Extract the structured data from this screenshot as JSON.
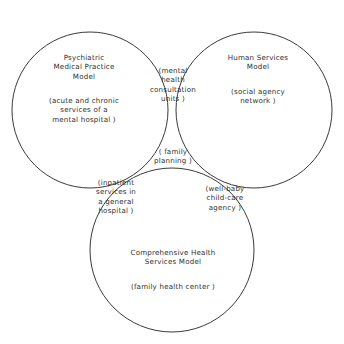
{
  "diagram": {
    "type": "venn",
    "title": "",
    "background_color": "#ffffff",
    "stroke_color": "#3a3a3a",
    "text_color": "#2f2f2f",
    "circles": [
      {
        "id": "psychiatric-medical-practice-model",
        "cx": 90,
        "cy": 110,
        "r": 78
      },
      {
        "id": "human-services-model",
        "cx": 254,
        "cy": 110,
        "r": 78
      },
      {
        "id": "comprehensive-health-services-model",
        "cx": 172,
        "cy": 250,
        "r": 82
      }
    ],
    "regions": {
      "left": {
        "name": "Psychiatric Medical Practice Model",
        "title": "Psychiatric\nMedical  Practice\nModel",
        "subtitle": "(acute  and  chronic\nservices  of  a\nmental  hospital )"
      },
      "right": {
        "name": "Human Services Model",
        "title": "Human  Services\nModel",
        "subtitle": "(social  agency\nnetwork )"
      },
      "bottom": {
        "name": "Comprehensive Health Services Model",
        "title": "Comprehensive  Health\nServices  Model",
        "subtitle": "(family  health  center )"
      },
      "top_center": {
        "name": "mental health consultation units",
        "title": "(mental\nhealth\nconsultation\nunits )"
      },
      "center": {
        "name": "family planning",
        "title": "( family\nplanning )"
      },
      "left_bottom": {
        "name": "inpatient services in a general hospital",
        "title": "(inpatient\nservices  in\na  general\nhospital )"
      },
      "right_bottom": {
        "name": "well-baby child-care agency",
        "title": "(well-baby\nchild-care\nagency )"
      }
    }
  }
}
